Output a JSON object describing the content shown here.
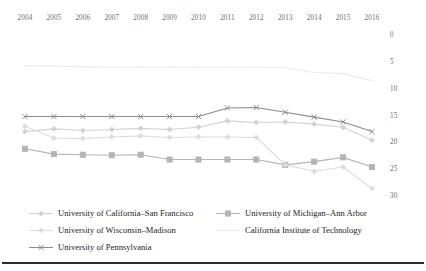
{
  "chart_data": {
    "type": "line",
    "title": "",
    "subtitle": "",
    "xlabel": "",
    "ylabel": "",
    "categories": [
      2004,
      2005,
      2006,
      2007,
      2008,
      2009,
      2010,
      2011,
      2012,
      2013,
      2014,
      2015,
      2016
    ],
    "x_tick_labels": [
      "2004",
      "2005",
      "2006",
      "2007",
      "2008",
      "2009",
      "2010",
      "2011",
      "2012",
      "2013",
      "2014",
      "2015",
      "2016"
    ],
    "y_tick_labels": [
      "0",
      "5",
      "10",
      "15",
      "20",
      "25",
      "30"
    ],
    "y_ticks": [
      0,
      5,
      10,
      15,
      20,
      25,
      30
    ],
    "ylim": [
      0,
      30
    ],
    "y_axis_inverted": true,
    "y_axis_position": "right",
    "x_axis_position": "top",
    "grid": false,
    "legend_position": "bottom",
    "series": [
      {
        "name": "University of California–San Francisco",
        "color": "#d2d2d2",
        "marker": "diamond",
        "values": [
          18.0,
          17.5,
          17.8,
          17.6,
          17.4,
          17.6,
          17.2,
          16.0,
          16.3,
          16.2,
          16.6,
          17.2,
          19.6
        ]
      },
      {
        "name": "University of Michigan–Ann Arbor",
        "color": "#b4b4b4",
        "marker": "square",
        "values": [
          21.2,
          22.2,
          22.3,
          22.4,
          22.3,
          23.2,
          23.2,
          23.2,
          23.2,
          24.2,
          23.6,
          22.8,
          24.6
        ]
      },
      {
        "name": "University of Wisconsin–Madison",
        "color": "#dcdcdc",
        "marker": "diamond",
        "values": [
          17.0,
          19.2,
          19.3,
          19.0,
          18.8,
          19.1,
          19.0,
          19.0,
          19.1,
          24.2,
          25.4,
          24.6,
          28.6
        ]
      },
      {
        "name": "California Institute of Technology",
        "color": "#ececec",
        "marker": "line",
        "values": [
          5.7,
          5.8,
          5.9,
          6.0,
          6.0,
          6.0,
          6.0,
          6.0,
          6.0,
          6.1,
          7.0,
          7.2,
          8.5
        ]
      },
      {
        "name": "University of Pennsylvania",
        "color": "#8c8c8c",
        "marker": "cross",
        "values": [
          15.2,
          15.2,
          15.2,
          15.2,
          15.2,
          15.2,
          15.2,
          13.6,
          13.5,
          14.4,
          15.3,
          16.2,
          18.0
        ]
      }
    ],
    "legend_entries": [
      "University of California–San Francisco",
      "University of Michigan–Ann Arbor",
      "University of Wisconsin–Madison",
      "California Institute of Technology",
      "University of Pennsylvania"
    ]
  }
}
